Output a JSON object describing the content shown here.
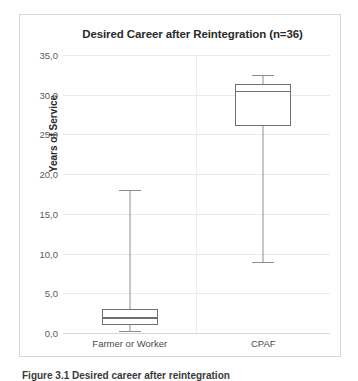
{
  "figure": {
    "caption": "Figure 3.1    Desired career after reintegration"
  },
  "chart_data": {
    "type": "box",
    "title": "Desired Career after Reintegration (n=36)",
    "xlabel": "",
    "ylabel": "Years of Service",
    "ylim": [
      0.0,
      35.0
    ],
    "ytick_step": 5.0,
    "grid": true,
    "legend": "none",
    "decimal_separator": ",",
    "categories": [
      "Farmer or Worker",
      "CPAF"
    ],
    "ytick_labels": [
      "35,0",
      "30,0",
      "25,0",
      "20,0",
      "15,0",
      "10,0",
      "5,0",
      "0,0"
    ],
    "ytick_values": [
      35.0,
      30.0,
      25.0,
      20.0,
      15.0,
      10.0,
      5.0,
      0.0
    ],
    "boxes": [
      {
        "name": "Farmer or Worker",
        "whisker_low": 0.3,
        "q1": 1.0,
        "median": 2.0,
        "q3": 3.0,
        "whisker_high": 18.0
      },
      {
        "name": "CPAF",
        "whisker_low": 9.0,
        "q1": 26.0,
        "median": 30.5,
        "q3": 31.3,
        "whisker_high": 32.5
      }
    ]
  },
  "colors": {
    "box_stroke": "#6f6f6f",
    "whisker_stroke": "#8d8d8d",
    "gridline": "#e9e9e9",
    "frame": "#d6d6d6",
    "title_text": "#2a2a2a",
    "tick_text": "#5a5a5a",
    "background": "#ffffff"
  }
}
